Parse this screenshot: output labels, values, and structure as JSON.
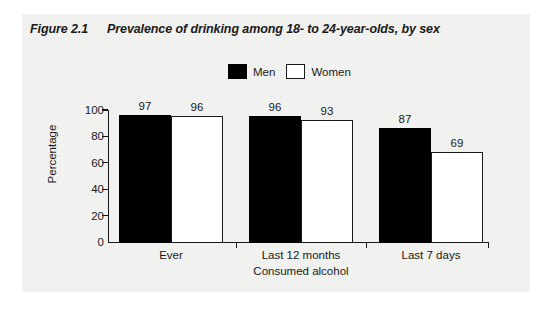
{
  "figure": {
    "number": "Figure 2.1",
    "title": "Prevalence of drinking among 18- to 24-year-olds, by sex"
  },
  "legend": {
    "position": "top-center",
    "entries": [
      {
        "label": "Men",
        "swatch": "black-square-icon",
        "color": "#000000"
      },
      {
        "label": "Women",
        "swatch": "white-square-icon",
        "color": "#ffffff"
      }
    ]
  },
  "chart_data": {
    "type": "bar",
    "title": "Prevalence of drinking among 18- to 24-year-olds, by sex",
    "categories": [
      "Ever",
      "Last 12 months",
      "Last 7 days"
    ],
    "series": [
      {
        "name": "Men",
        "values": [
          97,
          96,
          87
        ],
        "color": "#000000"
      },
      {
        "name": "Women",
        "values": [
          96,
          93,
          69
        ],
        "color": "#ffffff"
      }
    ],
    "xlabel": "Consumed alcohol",
    "ylabel": "Percentage",
    "ylim": [
      0,
      100
    ],
    "yticks": [
      0,
      20,
      40,
      60,
      80,
      100
    ],
    "ytick_labels": [
      "0",
      "20",
      "40",
      "60",
      "80",
      "100"
    ],
    "grid": false,
    "legend_position": "top-center",
    "data_labels": [
      "97",
      "96",
      "96",
      "93",
      "87",
      "69"
    ]
  },
  "colors": {
    "panel_background": "#f1f1ef",
    "page_background": "#ffffff",
    "ink": "#1a1a1a",
    "men_bar": "#000000",
    "women_bar": "#ffffff"
  }
}
